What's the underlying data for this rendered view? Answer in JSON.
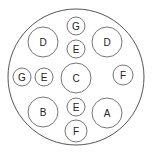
{
  "diagram": {
    "pins": [
      {
        "id": "pin-d-left",
        "label": "D"
      },
      {
        "id": "pin-g-top",
        "label": "G"
      },
      {
        "id": "pin-d-right",
        "label": "D"
      },
      {
        "id": "pin-e-top",
        "label": "E"
      },
      {
        "id": "pin-g-left",
        "label": "G"
      },
      {
        "id": "pin-e-left",
        "label": "E"
      },
      {
        "id": "pin-c-center",
        "label": "C"
      },
      {
        "id": "pin-f-right",
        "label": "F"
      },
      {
        "id": "pin-b",
        "label": "B"
      },
      {
        "id": "pin-e-bottom",
        "label": "E"
      },
      {
        "id": "pin-a",
        "label": "A"
      },
      {
        "id": "pin-f-bottom",
        "label": "F"
      }
    ]
  }
}
